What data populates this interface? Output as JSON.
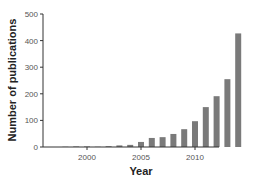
{
  "chart_data": {
    "type": "bar",
    "title": "",
    "xlabel": "Year",
    "ylabel": "Number of publications",
    "ylim": [
      0,
      500
    ],
    "yticks": [
      0,
      100,
      200,
      300,
      400,
      500
    ],
    "xticks": [
      2000,
      2005,
      2010
    ],
    "grid": false,
    "legend": null,
    "bar_color": "#7a7a7a",
    "categories": [
      1998,
      1999,
      2000,
      2001,
      2002,
      2003,
      2004,
      2005,
      2006,
      2007,
      2008,
      2009,
      2010,
      2011,
      2012,
      2013,
      2014
    ],
    "values": [
      1,
      2,
      2,
      1,
      3,
      6,
      8,
      19,
      34,
      37,
      49,
      67,
      97,
      150,
      191,
      255,
      427
    ]
  }
}
